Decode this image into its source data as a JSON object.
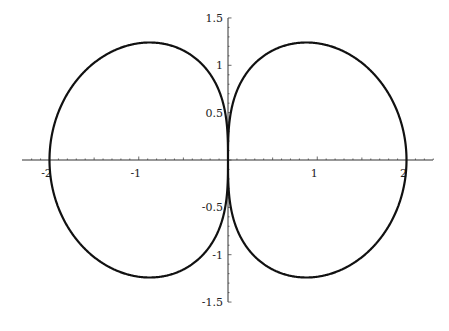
{
  "chart_data": {
    "type": "line",
    "title": "",
    "xlabel": "",
    "ylabel": "",
    "equation": "r^2 = 4|cos(theta)| (polar), i.e. r = 2*sqrt(|cos theta|)",
    "xlim": [
      -2.2,
      2.3
    ],
    "ylim": [
      -1.5,
      1.5
    ],
    "grid": false,
    "legend": null,
    "x_ticks": [
      {
        "value": -2,
        "label": "-2"
      },
      {
        "value": -1,
        "label": "-1"
      },
      {
        "value": 1,
        "label": "1"
      },
      {
        "value": 2,
        "label": "2"
      }
    ],
    "y_ticks": [
      {
        "value": 1.5,
        "label": "1.5"
      },
      {
        "value": 1,
        "label": "1"
      },
      {
        "value": 0.5,
        "label": "0.5"
      },
      {
        "value": -0.5,
        "label": "-0.5"
      },
      {
        "value": -1,
        "label": "-1"
      },
      {
        "value": -1.5,
        "label": "-1.5"
      }
    ],
    "series": [
      {
        "name": "curve",
        "color": "#111111",
        "key_points": [
          {
            "x": 2,
            "y": 0
          },
          {
            "x": 0.88,
            "y": 1.24
          },
          {
            "x": 0,
            "y": 0
          },
          {
            "x": 0.88,
            "y": -1.24
          },
          {
            "x": -2,
            "y": 0
          },
          {
            "x": -0.88,
            "y": 1.24
          },
          {
            "x": -0.88,
            "y": -1.24
          }
        ]
      }
    ]
  },
  "axes": {
    "x_px_per_unit": 89.25,
    "y_px_per_unit": 94.7,
    "origin_px": [
      228,
      160
    ],
    "x_axis_px_range": [
      22,
      433
    ],
    "y_axis_px_range": [
      18,
      302
    ]
  }
}
